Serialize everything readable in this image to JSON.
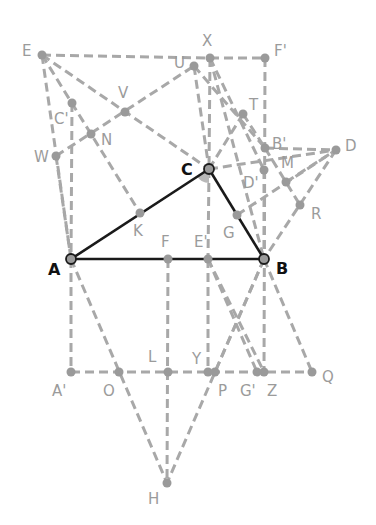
{
  "diagram": {
    "type": "geometry-construction",
    "colors": {
      "construction": "#a8a8a8",
      "triangle": "#1a1a1a",
      "angle_fill": "#b8b8b8",
      "point": "#9a9a9a",
      "label": "#9b9b9b",
      "main_label": "#111111"
    },
    "triangle": [
      "A",
      "B",
      "C"
    ],
    "points": {
      "E": [
        42,
        55
      ],
      "X": [
        210,
        58
      ],
      "U": [
        194,
        66
      ],
      "F'": [
        265,
        58
      ],
      "V": [
        125,
        112
      ],
      "C'": [
        72,
        103
      ],
      "N": [
        91,
        134
      ],
      "W": [
        56,
        156
      ],
      "T": [
        243,
        114
      ],
      "B'": [
        265,
        148
      ],
      "D": [
        336,
        150
      ],
      "C": [
        209,
        169
      ],
      "D'": [
        264,
        170
      ],
      "M": [
        286,
        182
      ],
      "R": [
        300,
        205
      ],
      "G": [
        237,
        215
      ],
      "K": [
        140,
        213
      ],
      "A": [
        71,
        259
      ],
      "F": [
        168,
        259
      ],
      "E'": [
        208,
        259
      ],
      "B": [
        264,
        259
      ],
      "A'": [
        71,
        372
      ],
      "O": [
        119,
        372
      ],
      "L": [
        168,
        372
      ],
      "Y": [
        208,
        372
      ],
      "P": [
        215,
        372
      ],
      "G'": [
        257,
        372
      ],
      "Z": [
        264,
        372
      ],
      "Q": [
        312,
        372
      ],
      "H": [
        167,
        483
      ]
    },
    "labels": [
      {
        "id": "E",
        "text": "E",
        "x": 22,
        "y": 44
      },
      {
        "id": "X",
        "text": "X",
        "x": 202,
        "y": 34
      },
      {
        "id": "U",
        "text": "U",
        "x": 174,
        "y": 56
      },
      {
        "id": "F'",
        "text": "F'",
        "x": 274,
        "y": 44
      },
      {
        "id": "V",
        "text": "V",
        "x": 118,
        "y": 86
      },
      {
        "id": "C'",
        "text": "C'",
        "x": 54,
        "y": 112
      },
      {
        "id": "N",
        "text": "N",
        "x": 101,
        "y": 133
      },
      {
        "id": "W",
        "text": "W",
        "x": 34,
        "y": 150
      },
      {
        "id": "T",
        "text": "T",
        "x": 249,
        "y": 98
      },
      {
        "id": "B'",
        "text": "B'",
        "x": 272,
        "y": 137
      },
      {
        "id": "D",
        "text": "D",
        "x": 345,
        "y": 139
      },
      {
        "id": "C",
        "text": "C",
        "x": 181,
        "y": 162,
        "main": true
      },
      {
        "id": "D'",
        "text": "D'",
        "x": 243,
        "y": 176
      },
      {
        "id": "M",
        "text": "M",
        "x": 281,
        "y": 156
      },
      {
        "id": "R",
        "text": "R",
        "x": 311,
        "y": 207
      },
      {
        "id": "G",
        "text": "G",
        "x": 223,
        "y": 226
      },
      {
        "id": "K",
        "text": "K",
        "x": 133,
        "y": 224
      },
      {
        "id": "A",
        "text": "A",
        "x": 48,
        "y": 262,
        "main": true
      },
      {
        "id": "F",
        "text": "F",
        "x": 161,
        "y": 235
      },
      {
        "id": "E'",
        "text": "E'",
        "x": 194,
        "y": 235
      },
      {
        "id": "B",
        "text": "B",
        "x": 276,
        "y": 261,
        "main": true
      },
      {
        "id": "A'",
        "text": "A'",
        "x": 52,
        "y": 384
      },
      {
        "id": "O",
        "text": "O",
        "x": 103,
        "y": 384
      },
      {
        "id": "L",
        "text": "L",
        "x": 148,
        "y": 350
      },
      {
        "id": "Y",
        "text": "Y",
        "x": 192,
        "y": 352
      },
      {
        "id": "P",
        "text": "P",
        "x": 218,
        "y": 384
      },
      {
        "id": "G'",
        "text": "G'",
        "x": 240,
        "y": 384
      },
      {
        "id": "Z",
        "text": "Z",
        "x": 267,
        "y": 384
      },
      {
        "id": "Q",
        "text": "Q",
        "x": 322,
        "y": 370
      },
      {
        "id": "H",
        "text": "H",
        "x": 148,
        "y": 492
      }
    ],
    "solid_segments": [
      [
        "A",
        "B"
      ],
      [
        "B",
        "C"
      ],
      [
        "C",
        "A"
      ]
    ],
    "dashed_segments": [
      [
        "E",
        "X"
      ],
      [
        "E",
        "A"
      ],
      [
        "E",
        "C"
      ],
      [
        "E",
        "K"
      ],
      [
        "C'",
        "A"
      ],
      [
        "W",
        "U"
      ],
      [
        "W",
        "A"
      ],
      [
        "X",
        "F'"
      ],
      [
        "F'",
        "Z"
      ],
      [
        "X",
        "C"
      ],
      [
        "X",
        "D'"
      ],
      [
        "X",
        "B"
      ],
      [
        "U",
        "C"
      ],
      [
        "U",
        "B'"
      ],
      [
        "C",
        "T"
      ],
      [
        "C",
        "D"
      ],
      [
        "B'",
        "D"
      ],
      [
        "M",
        "D"
      ],
      [
        "C",
        "E'"
      ],
      [
        "G",
        "D"
      ],
      [
        "T",
        "B'"
      ],
      [
        "B'",
        "R"
      ],
      [
        "D",
        "B"
      ],
      [
        "A",
        "A'"
      ],
      [
        "A",
        "H"
      ],
      [
        "A'",
        "Q"
      ],
      [
        "F",
        "H"
      ],
      [
        "B",
        "H"
      ],
      [
        "B",
        "Q"
      ],
      [
        "E'",
        "Y"
      ],
      [
        "E'",
        "G'"
      ],
      [
        "E'",
        "Z"
      ],
      [
        "B",
        "P"
      ],
      [
        "D'",
        "B"
      ]
    ],
    "angle_marker": {
      "vertex": "C",
      "radius": 14,
      "from_deg": 90,
      "to_deg": 150
    }
  }
}
